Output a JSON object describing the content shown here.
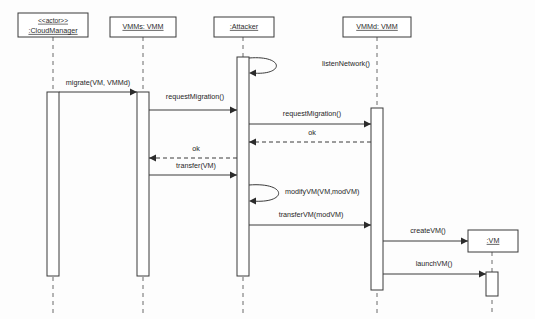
{
  "diagram": {
    "type": "uml-sequence-diagram",
    "canvas": {
      "width": 535,
      "height": 319,
      "background": "#fdfdfd"
    },
    "colors": {
      "stroke": "#3a3a3a",
      "lifeline": "#6b6b6b",
      "text": "#262626",
      "background": "#ffffff"
    }
  },
  "lifelines": [
    {
      "id": "cloudmanager",
      "stereotype": "<<actor>>",
      "label": ":CloudManager",
      "x": 53,
      "box": {
        "x": 18,
        "y": 13,
        "width": 70,
        "height": 24
      },
      "lifeline_bottom": 313,
      "activation": {
        "x": 47,
        "y": 92,
        "width": 12,
        "height": 184
      }
    },
    {
      "id": "vmms",
      "stereotype": "",
      "label": "VMMs: VMM",
      "x": 143,
      "box": {
        "x": 110,
        "y": 17,
        "width": 66,
        "height": 20
      },
      "lifeline_bottom": 313,
      "activation": {
        "x": 137,
        "y": 92,
        "width": 12,
        "height": 184
      }
    },
    {
      "id": "attacker",
      "stereotype": "",
      "label": ":Attacker",
      "x": 243,
      "box": {
        "x": 214,
        "y": 17,
        "width": 60,
        "height": 20
      },
      "lifeline_bottom": 313,
      "activation": {
        "x": 237,
        "y": 57,
        "width": 12,
        "height": 219
      }
    },
    {
      "id": "vmmd",
      "stereotype": "",
      "label": "VMMd: VMM",
      "x": 377,
      "box": {
        "x": 343,
        "y": 17,
        "width": 68,
        "height": 20
      },
      "lifeline_bottom": 313,
      "activation": {
        "x": 371,
        "y": 108,
        "width": 12,
        "height": 182
      }
    },
    {
      "id": "vm",
      "stereotype": "",
      "label": ":VM",
      "x": 492,
      "box": {
        "x": 468,
        "y": 230,
        "width": 50,
        "height": 22
      },
      "lifeline_bottom": 313,
      "activation": {
        "x": 486,
        "y": 272,
        "width": 12,
        "height": 24
      }
    }
  ],
  "messages": [
    {
      "id": "m1",
      "label": "migrate(VM, VMMd)",
      "from": "cloudmanager",
      "to": "vmms",
      "kind": "call",
      "style": "solid",
      "y": 92,
      "label_y": 82,
      "direction": "right"
    },
    {
      "id": "m2",
      "label": "listenNetwork()",
      "from": "attacker",
      "to": "attacker",
      "kind": "self-call",
      "style": "solid",
      "y": 58,
      "y_end": 73,
      "label_x": 322,
      "label_y": 64,
      "direction": "self"
    },
    {
      "id": "m3",
      "label": "requestMigration()",
      "from": "vmms",
      "to": "attacker",
      "kind": "call",
      "style": "solid",
      "y": 110,
      "label_y": 96,
      "direction": "right"
    },
    {
      "id": "m4",
      "label": "requestMigration()",
      "from": "attacker",
      "to": "vmmd",
      "kind": "call",
      "style": "solid",
      "y": 124,
      "label_y": 114,
      "direction": "right"
    },
    {
      "id": "m5",
      "label": "ok",
      "from": "vmmd",
      "to": "attacker",
      "kind": "return",
      "style": "dashed",
      "y": 142,
      "label_y": 133,
      "direction": "left"
    },
    {
      "id": "m6",
      "label": "ok",
      "from": "attacker",
      "to": "vmms",
      "kind": "return",
      "style": "dashed",
      "y": 158,
      "label_y": 149,
      "direction": "left"
    },
    {
      "id": "m7",
      "label": "transfer(VM)",
      "from": "vmms",
      "to": "attacker",
      "kind": "call",
      "style": "solid",
      "y": 175,
      "label_y": 166,
      "direction": "right"
    },
    {
      "id": "m8",
      "label": "modifyVM(VM,modVM)",
      "from": "attacker",
      "to": "attacker",
      "kind": "self-call",
      "style": "solid",
      "y": 185,
      "y_end": 201,
      "label_x": 330,
      "label_y": 192,
      "direction": "self"
    },
    {
      "id": "m9",
      "label": "transferVM(modVM)",
      "from": "attacker",
      "to": "vmmd",
      "kind": "call",
      "style": "solid",
      "y": 225,
      "label_y": 215,
      "direction": "right"
    },
    {
      "id": "m10",
      "label": "createVM()",
      "from": "vmmd",
      "to": "vm",
      "kind": "create",
      "style": "solid",
      "y": 241,
      "label_y": 231,
      "direction": "right"
    },
    {
      "id": "m11",
      "label": "launchVM()",
      "from": "vmmd",
      "to": "vm",
      "kind": "call",
      "style": "solid",
      "y": 274,
      "label_y": 264,
      "direction": "right"
    }
  ]
}
